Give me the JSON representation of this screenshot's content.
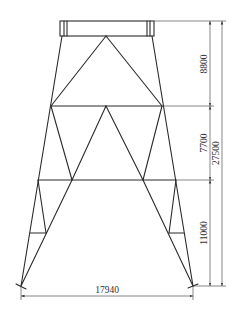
{
  "diagram": {
    "type": "structural frame elevation (tower / jacket)",
    "colors": {
      "line": "#2a2a2a",
      "dimension": "#555555",
      "background": "#ffffff"
    },
    "dimensions": {
      "upper_panel_height": "8800",
      "middle_panel_height": "7700",
      "lower_panel_height": "11000",
      "total_height": "27500",
      "base_width": "17940"
    }
  }
}
